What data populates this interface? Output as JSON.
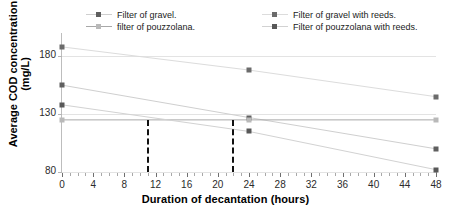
{
  "chart_data": {
    "type": "line",
    "title": "",
    "xlabel": "Duration of decantation (hours)",
    "ylabel": "Average COD concentration (mg/L)",
    "xlim": [
      0,
      48
    ],
    "ylim": [
      80,
      200
    ],
    "xticks": [
      0,
      4,
      8,
      12,
      16,
      20,
      24,
      28,
      32,
      36,
      40,
      44,
      48
    ],
    "xtick_labels": [
      "0",
      "4",
      "8",
      "12",
      "16",
      "20",
      "24",
      "28",
      "32",
      "36",
      "40",
      "44",
      "48"
    ],
    "yticks": [
      80,
      130,
      180
    ],
    "ytick_labels": [
      "80",
      "130",
      "180"
    ],
    "grid": true,
    "legend_position": "top",
    "x": [
      0,
      24,
      48
    ],
    "series": [
      {
        "name": "Filter of gravel.",
        "values": [
          155,
          127,
          100
        ],
        "color": "#5f5f5f",
        "marker": "square",
        "line_color": "#cfcfcf"
      },
      {
        "name": "filter of pouzzolana.",
        "values": [
          125,
          125,
          125
        ],
        "color": "#b9b9b9",
        "marker": "square",
        "line_color": "#a8a8a8"
      },
      {
        "name": "Filter of gravel with reeds.",
        "values": [
          188,
          168,
          145
        ],
        "color": "#6b6b6b",
        "marker": "square",
        "line_color": "#dcdcdc"
      },
      {
        "name": "Filter of pouzzolana with reeds.",
        "values": [
          138,
          115,
          82
        ],
        "color": "#585858",
        "marker": "square",
        "line_color": "#d2d2d2"
      }
    ],
    "annotations": [
      {
        "type": "vertical-dashed-line",
        "x": 11,
        "color": "#111111"
      },
      {
        "type": "vertical-dashed-line",
        "x": 22,
        "color": "#111111"
      }
    ]
  }
}
